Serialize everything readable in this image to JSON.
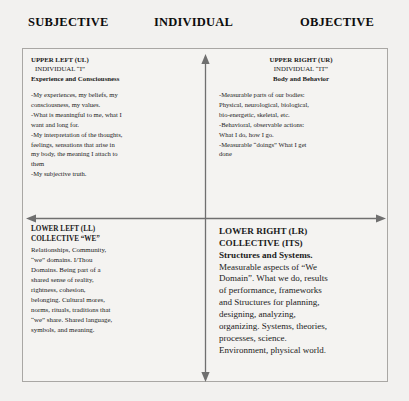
{
  "axes": {
    "left_label": "SUBJECTIVE",
    "center_label": "INDIVIDUAL",
    "right_label": "OBJECTIVE",
    "vertical_arrow": "double-headed vertical axis",
    "horizontal_arrow": "double-headed horizontal axis",
    "line_color": "#6f6f6f"
  },
  "frame": {
    "border_color": "#a9a7a4",
    "background": "#f4f3f1"
  },
  "quadrants": {
    "upper_left": {
      "title": "UPPER LEFT (UL)",
      "subtitle": "INDIVIDUAL  “I”",
      "heading": "Experience and Consciousness",
      "body": "-My experiences, my beliefs, my\nconsciousness, my values.\n-What is meaningful to me, what I\nwant and long for.\n-My interpretation of the thoughts,\nfeelings, sensations that arise in\nmy body, the meaning I attach to\nthem\n-My subjective truth."
    },
    "upper_right": {
      "title": "UPPER RIGHT (UR)",
      "subtitle": "INDIVIDUAL “IT”",
      "heading": "Body and Behavior",
      "body": "-Measurable parts of our bodies:\nPhysical, neurological, biological,\nbio-energetic, skeletal, etc.\n-Behavioral, observable actions:\nWhat I do, how I go.\n-Measurable “doings” What I get\ndone"
    },
    "lower_left": {
      "title": "LOWER LEFT (LL)",
      "subtitle": "COLLECTIVE “WE”",
      "body": "Relationships, Community,\n“we” domains. I/Thou\nDomains. Being part of a\nshared sense of reality,\nrightness, cohesion,\nbelonging. Cultural mores,\nnorms, rituals, traditions that\n“we” share. Shared language,\nsymbols, and meaning."
    },
    "lower_right": {
      "title": "LOWER RIGHT (LR)",
      "subtitle": "COLLECTIVE (ITS)",
      "heading": "Structures and Systems.",
      "body": "Measurable aspects of “We\nDomain”. What we do, results\nof performance, frameworks\nand Structures for planning,\ndesigning, analyzing,\norganizing. Systems, theories,\nprocesses, science.\nEnvironment, physical world."
    }
  }
}
